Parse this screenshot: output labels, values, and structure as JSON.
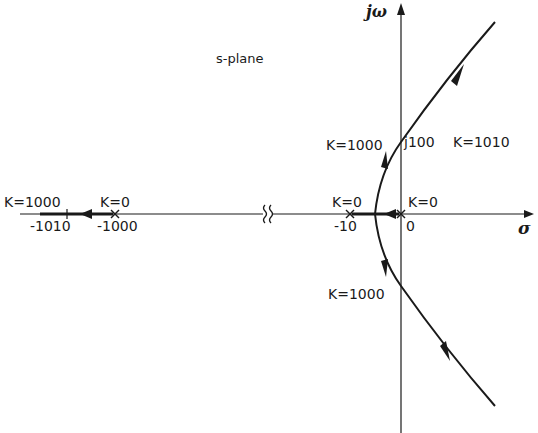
{
  "plane_label": "s-plane",
  "axes": {
    "horizontal_label": "σ",
    "vertical_label": "jω"
  },
  "poles": [
    {
      "value": -1000,
      "tick_label": "-1000",
      "gain_label": "K=0"
    },
    {
      "value": -10,
      "tick_label": "-10",
      "gain_label": "K=0"
    },
    {
      "value": 0,
      "tick_label": "0",
      "gain_label": "K=0"
    }
  ],
  "points": {
    "left_end": {
      "tick_label": "-1010",
      "gain_label": "K=1000"
    },
    "upper_crossing": {
      "tick_label": "j100",
      "gain_label_left": "K=1000",
      "gain_label_right": "K=1010"
    },
    "lower_crossing": {
      "gain_label": "K=1000"
    }
  },
  "break_symbol": "axis-break",
  "colors": {
    "line": "#1a1a1a",
    "background": "#ffffff"
  }
}
